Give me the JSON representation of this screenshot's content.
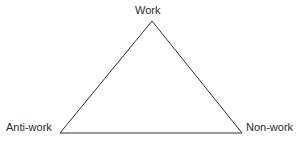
{
  "diagram": {
    "type": "triangle-diagram",
    "background_color": "#ffffff",
    "line_color": "#333333",
    "text_color": "#2b2b2b",
    "line_width": 1,
    "vertices": [
      {
        "id": "apex",
        "label": "Work",
        "x": 152,
        "y": 21
      },
      {
        "id": "bottom-left",
        "label": "Anti-work",
        "x": 60,
        "y": 133
      },
      {
        "id": "bottom-right",
        "label": "Non-work",
        "x": 242,
        "y": 133
      }
    ],
    "labels": {
      "apex": "Work",
      "bottom_left": "Anti-work",
      "bottom_right": "Non-work"
    }
  }
}
